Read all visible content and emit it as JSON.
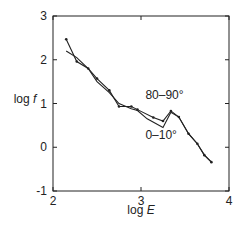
{
  "chart_data": {
    "type": "line",
    "title": "",
    "xlabel": "log E",
    "ylabel": "log f",
    "xlim": [
      2,
      4
    ],
    "ylim": [
      -1,
      3
    ],
    "xticks": [
      "2",
      "3",
      "4"
    ],
    "yticks": [
      "-1",
      "0",
      "1",
      "2",
      "3"
    ],
    "grid": false,
    "series": [
      {
        "name": "80–90°",
        "markers": true,
        "x": [
          2.15,
          2.27,
          2.4,
          2.5,
          2.64,
          2.75,
          2.89,
          2.96,
          3.14,
          3.25,
          3.34,
          3.43,
          3.54,
          3.64,
          3.72,
          3.8
        ],
        "y": [
          2.47,
          1.96,
          1.8,
          1.57,
          1.3,
          0.93,
          0.93,
          0.86,
          0.68,
          0.6,
          0.83,
          0.69,
          0.31,
          0.08,
          -0.18,
          -0.34
        ]
      },
      {
        "name": "0–10°",
        "markers": false,
        "x": [
          2.15,
          2.27,
          2.4,
          2.5,
          2.64,
          2.75,
          2.89,
          2.96,
          3.07,
          3.25,
          3.34,
          3.43,
          3.54,
          3.64,
          3.72,
          3.8
        ],
        "y": [
          2.2,
          2.05,
          1.8,
          1.5,
          1.25,
          1.0,
          0.88,
          0.84,
          0.65,
          0.45,
          0.8,
          0.69,
          0.31,
          0.08,
          -0.18,
          -0.34
        ]
      }
    ],
    "annotations": [
      {
        "text": "80–90°",
        "x": 3.05,
        "y": 1.1
      },
      {
        "text": "0–10°",
        "x": 3.05,
        "y": 0.2
      }
    ]
  }
}
